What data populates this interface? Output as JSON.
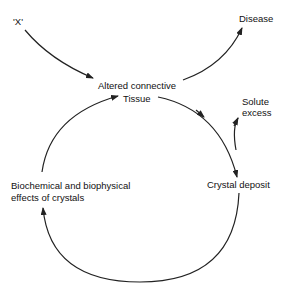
{
  "diagram": {
    "nodes": {
      "x": "'X'",
      "disease": "Disease",
      "altered_line1": "Altered connective",
      "altered_line2": "Tissue",
      "solute_line1": "Solute",
      "solute_line2": "excess",
      "crystal": "Crystal deposit",
      "effects_line1": "Biochemical and biophysical",
      "effects_line2": "effects of crystals"
    },
    "edges": [
      {
        "from": "'X'",
        "to": "Altered connective Tissue"
      },
      {
        "from": "Altered connective Tissue",
        "to": "Disease"
      },
      {
        "from": "Altered connective Tissue",
        "to": "Crystal deposit"
      },
      {
        "from": "Solute excess",
        "to": "Crystal deposit"
      },
      {
        "from": "Crystal deposit",
        "to": "Biochemical and biophysical effects of crystals"
      },
      {
        "from": "Biochemical and biophysical effects of crystals",
        "to": "Altered connective Tissue"
      }
    ],
    "colors": {
      "line": "#222222",
      "text": "#111111",
      "background": "#ffffff"
    }
  }
}
